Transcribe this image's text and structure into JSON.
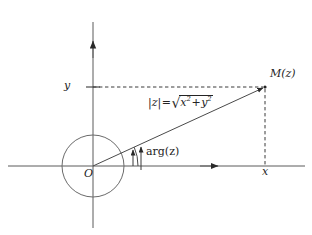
{
  "figure": {
    "type": "complex-plane-diagram",
    "background_color": "#ffffff",
    "line_color": "#4a4a4a",
    "text_color": "#242424",
    "width": 312,
    "height": 235
  },
  "labels": {
    "origin": "O",
    "y_axis_value": "y",
    "x_axis_value": "x",
    "point": "M(z)",
    "argument": "arg(z)",
    "modulus_lhs": "|z|",
    "modulus_equals": "=",
    "modulus_radicand_x": "x",
    "modulus_radicand_exp_x": "2",
    "modulus_radicand_plus": "+",
    "modulus_radicand_y": "y",
    "modulus_radicand_exp_y": "2",
    "modulus_full": "|z| = √(x²+y²)",
    "sqrt_symbol": "√"
  },
  "geometry": {
    "origin_x": 93,
    "origin_y": 166,
    "point_x": 265,
    "point_y": 87,
    "circle_radius": 31,
    "x_axis_start": 8,
    "x_axis_end": 305,
    "y_axis_top": 22,
    "y_axis_bottom": 228,
    "x_arrow_head_x": 218,
    "y_arrow_head_y": 41,
    "angle_degrees": 25,
    "arc_radius": 45
  },
  "elements": {
    "x_axis_name": "x-axis",
    "y_axis_name": "y-axis",
    "unit_circle_name": "unit-circle",
    "radius_vector_name": "radius-vector",
    "angle_arc_name": "argument-arc",
    "projection_horizontal_name": "horizontal-projection-dashed",
    "projection_vertical_name": "vertical-projection-dashed"
  }
}
